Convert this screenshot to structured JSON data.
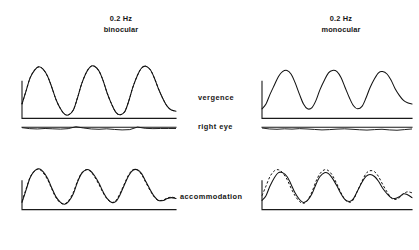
{
  "figure": {
    "columns": [
      {
        "id": "binocular",
        "frequency": "0.2 Hz",
        "condition": "binocular"
      },
      {
        "id": "monocular",
        "frequency": "0.2 Hz",
        "condition": "monocular"
      }
    ],
    "row_labels": {
      "vergence": "vergence",
      "right_eye": "right eye",
      "accommodation": "accommodation"
    },
    "colors": {
      "trace": "#111111",
      "axis": "#1a1a1a",
      "background": "#ffffff",
      "text": "#161616"
    }
  },
  "chart_data": {
    "type": "line",
    "xlabel": "",
    "ylabel": "",
    "grid": false,
    "legend_position": "none",
    "x_unit": "time (three stimulus cycles at 0.2 Hz)",
    "cycles": 3,
    "axis_style": "L-shaped calibration axis (vertical calibration bar plus horizontal time baseline)",
    "panels": [
      {
        "id": "vergence-binocular",
        "column": "binocular",
        "row": "vergence",
        "xlim": [
          0,
          3
        ],
        "ylim": [
          0,
          1
        ],
        "baseline": 0.06,
        "series": [
          {
            "name": "vergence response",
            "style": "solid",
            "phase_deg": 0,
            "amplitude": 0.78,
            "mean": 0.46,
            "x": [
              0.0,
              0.08,
              0.16,
              0.25,
              0.33,
              0.41,
              0.5,
              0.58,
              0.66,
              0.75,
              0.83,
              0.91,
              1.0,
              1.08,
              1.16,
              1.25,
              1.33,
              1.41,
              1.5,
              1.58,
              1.66,
              1.75,
              1.83,
              1.91,
              2.0,
              2.08,
              2.16,
              2.25,
              2.33,
              2.41,
              2.5,
              2.58,
              2.66,
              2.75,
              2.83,
              2.91,
              3.0
            ],
            "values": [
              0.3,
              0.52,
              0.74,
              0.87,
              0.92,
              0.88,
              0.76,
              0.58,
              0.38,
              0.22,
              0.13,
              0.12,
              0.2,
              0.4,
              0.63,
              0.82,
              0.92,
              0.93,
              0.85,
              0.69,
              0.48,
              0.29,
              0.16,
              0.12,
              0.17,
              0.35,
              0.58,
              0.78,
              0.9,
              0.93,
              0.87,
              0.73,
              0.55,
              0.38,
              0.26,
              0.2,
              0.18
            ]
          },
          {
            "name": "vergence stimulus",
            "style": "dashed",
            "phase_deg": 0,
            "amplitude": 0.78,
            "mean": 0.46,
            "note": "overlays the response almost exactly; visible mainly on descending limbs",
            "x": [
              0.0,
              0.08,
              0.16,
              0.25,
              0.33,
              0.41,
              0.5,
              0.58,
              0.66,
              0.75,
              0.83,
              0.91,
              1.0,
              1.08,
              1.16,
              1.25,
              1.33,
              1.41,
              1.5,
              1.58,
              1.66,
              1.75,
              1.83,
              1.91,
              2.0,
              2.08,
              2.16,
              2.25,
              2.33,
              2.41,
              2.5,
              2.58,
              2.66,
              2.75,
              2.83,
              2.91,
              3.0
            ],
            "values": [
              0.3,
              0.52,
              0.74,
              0.87,
              0.92,
              0.88,
              0.76,
              0.58,
              0.38,
              0.22,
              0.13,
              0.12,
              0.2,
              0.4,
              0.63,
              0.82,
              0.92,
              0.93,
              0.85,
              0.69,
              0.48,
              0.29,
              0.16,
              0.12,
              0.17,
              0.35,
              0.58,
              0.78,
              0.9,
              0.93,
              0.87,
              0.73,
              0.55,
              0.38,
              0.26,
              0.2,
              0.18
            ]
          }
        ]
      },
      {
        "id": "vergence-monocular",
        "column": "monocular",
        "row": "vergence",
        "xlim": [
          0,
          3
        ],
        "ylim": [
          0,
          1
        ],
        "baseline": 0.06,
        "series": [
          {
            "name": "vergence response",
            "style": "solid",
            "phase_deg": 0,
            "amplitude": 0.62,
            "mean": 0.48,
            "note": "no dashed stimulus trace shown; response is smaller and flat-topped",
            "x": [
              0.0,
              0.08,
              0.16,
              0.25,
              0.33,
              0.41,
              0.5,
              0.58,
              0.66,
              0.75,
              0.83,
              0.91,
              1.0,
              1.08,
              1.16,
              1.25,
              1.33,
              1.41,
              1.5,
              1.58,
              1.66,
              1.75,
              1.83,
              1.91,
              2.0,
              2.08,
              2.16,
              2.25,
              2.33,
              2.41,
              2.5,
              2.58,
              2.66,
              2.75,
              2.83,
              2.91,
              3.0
            ],
            "values": [
              0.22,
              0.3,
              0.46,
              0.62,
              0.76,
              0.84,
              0.86,
              0.8,
              0.66,
              0.46,
              0.3,
              0.22,
              0.24,
              0.36,
              0.54,
              0.7,
              0.82,
              0.86,
              0.84,
              0.74,
              0.58,
              0.4,
              0.27,
              0.22,
              0.26,
              0.4,
              0.57,
              0.72,
              0.82,
              0.84,
              0.8,
              0.7,
              0.56,
              0.44,
              0.36,
              0.32,
              0.3
            ]
          }
        ]
      },
      {
        "id": "righteye-binocular",
        "column": "binocular",
        "row": "right_eye",
        "xlim": [
          0,
          3
        ],
        "ylim": [
          0,
          1
        ],
        "baseline": 0.55,
        "series": [
          {
            "name": "right eye position",
            "style": "solid-noisy",
            "amplitude": 0.06,
            "mean": 0.5,
            "note": "essentially flat with small noise excursions",
            "x": [
              0.0,
              0.15,
              0.3,
              0.45,
              0.6,
              0.75,
              0.9,
              1.05,
              1.2,
              1.35,
              1.5,
              1.65,
              1.8,
              1.95,
              2.1,
              2.25,
              2.4,
              2.55,
              2.7,
              2.85,
              3.0
            ],
            "values": [
              0.52,
              0.46,
              0.44,
              0.47,
              0.45,
              0.43,
              0.46,
              0.58,
              0.5,
              0.44,
              0.42,
              0.45,
              0.41,
              0.38,
              0.4,
              0.56,
              0.48,
              0.46,
              0.47,
              0.47,
              0.47
            ]
          }
        ]
      },
      {
        "id": "righteye-monocular",
        "column": "monocular",
        "row": "right_eye",
        "xlim": [
          0,
          3
        ],
        "ylim": [
          0,
          1
        ],
        "baseline": 0.55,
        "series": [
          {
            "name": "right eye position",
            "style": "solid-noisy",
            "amplitude": 0.07,
            "mean": 0.5,
            "note": "essentially flat with small noise excursions",
            "x": [
              0.0,
              0.15,
              0.3,
              0.45,
              0.6,
              0.75,
              0.9,
              1.05,
              1.2,
              1.35,
              1.5,
              1.65,
              1.8,
              1.95,
              2.1,
              2.25,
              2.4,
              2.55,
              2.7,
              2.85,
              3.0
            ],
            "values": [
              0.5,
              0.44,
              0.42,
              0.45,
              0.43,
              0.46,
              0.44,
              0.41,
              0.38,
              0.4,
              0.43,
              0.45,
              0.42,
              0.39,
              0.37,
              0.4,
              0.42,
              0.38,
              0.36,
              0.4,
              0.44
            ]
          }
        ]
      },
      {
        "id": "accommodation-binocular",
        "column": "binocular",
        "row": "accommodation",
        "xlim": [
          0,
          3
        ],
        "ylim": [
          0,
          1
        ],
        "baseline": 0.05,
        "series": [
          {
            "name": "accommodation response",
            "style": "solid",
            "phase_deg": 0,
            "amplitude": 0.72,
            "mean": 0.48,
            "x": [
              0.0,
              0.08,
              0.16,
              0.25,
              0.33,
              0.41,
              0.5,
              0.58,
              0.66,
              0.75,
              0.83,
              0.91,
              1.0,
              1.08,
              1.16,
              1.25,
              1.33,
              1.41,
              1.5,
              1.58,
              1.66,
              1.75,
              1.83,
              1.91,
              2.0,
              2.08,
              2.16,
              2.25,
              2.33,
              2.41,
              2.5,
              2.58,
              2.66,
              2.75,
              2.83,
              2.91,
              3.0
            ],
            "values": [
              0.2,
              0.46,
              0.72,
              0.86,
              0.9,
              0.84,
              0.7,
              0.5,
              0.32,
              0.2,
              0.16,
              0.22,
              0.38,
              0.62,
              0.8,
              0.88,
              0.86,
              0.76,
              0.6,
              0.42,
              0.28,
              0.2,
              0.22,
              0.36,
              0.58,
              0.76,
              0.87,
              0.88,
              0.8,
              0.64,
              0.46,
              0.32,
              0.24,
              0.24,
              0.28,
              0.3,
              0.28
            ]
          },
          {
            "name": "accommodation stimulus",
            "style": "dashed",
            "phase_deg": 0,
            "amplitude": 0.72,
            "mean": 0.48,
            "note": "near-perfect overlay with the response under binocular viewing",
            "x": [
              0.0,
              0.08,
              0.16,
              0.25,
              0.33,
              0.41,
              0.5,
              0.58,
              0.66,
              0.75,
              0.83,
              0.91,
              1.0,
              1.08,
              1.16,
              1.25,
              1.33,
              1.41,
              1.5,
              1.58,
              1.66,
              1.75,
              1.83,
              1.91,
              2.0,
              2.08,
              2.16,
              2.25,
              2.33,
              2.41,
              2.5,
              2.58,
              2.66,
              2.75,
              2.83,
              2.91,
              3.0
            ],
            "values": [
              0.22,
              0.48,
              0.73,
              0.86,
              0.89,
              0.82,
              0.67,
              0.48,
              0.3,
              0.19,
              0.17,
              0.24,
              0.41,
              0.64,
              0.81,
              0.88,
              0.85,
              0.74,
              0.57,
              0.4,
              0.27,
              0.2,
              0.24,
              0.39,
              0.6,
              0.78,
              0.88,
              0.87,
              0.78,
              0.62,
              0.44,
              0.31,
              0.24,
              0.25,
              0.29,
              0.31,
              0.29
            ]
          }
        ]
      },
      {
        "id": "accommodation-monocular",
        "column": "monocular",
        "row": "accommodation",
        "xlim": [
          0,
          3
        ],
        "ylim": [
          0,
          1
        ],
        "baseline": 0.05,
        "series": [
          {
            "name": "accommodation response",
            "style": "solid",
            "phase_deg": -28,
            "amplitude": 0.64,
            "mean": 0.46,
            "note": "lags the dashed stimulus by a visible phase offset",
            "x": [
              0.0,
              0.08,
              0.16,
              0.25,
              0.33,
              0.41,
              0.5,
              0.58,
              0.66,
              0.75,
              0.83,
              0.91,
              1.0,
              1.08,
              1.16,
              1.25,
              1.33,
              1.41,
              1.5,
              1.58,
              1.66,
              1.75,
              1.83,
              1.91,
              2.0,
              2.08,
              2.16,
              2.25,
              2.33,
              2.41,
              2.5,
              2.58,
              2.66,
              2.75,
              2.83,
              2.91,
              3.0
            ],
            "values": [
              0.24,
              0.34,
              0.54,
              0.72,
              0.82,
              0.82,
              0.74,
              0.58,
              0.4,
              0.26,
              0.2,
              0.24,
              0.38,
              0.58,
              0.74,
              0.82,
              0.8,
              0.7,
              0.54,
              0.38,
              0.26,
              0.22,
              0.28,
              0.44,
              0.62,
              0.74,
              0.78,
              0.74,
              0.64,
              0.5,
              0.38,
              0.3,
              0.28,
              0.32,
              0.38,
              0.36,
              0.3
            ]
          },
          {
            "name": "accommodation stimulus",
            "style": "dashed",
            "phase_deg": 0,
            "amplitude": 0.68,
            "mean": 0.46,
            "note": "leads the solid response trace",
            "x": [
              0.0,
              0.08,
              0.16,
              0.25,
              0.33,
              0.41,
              0.5,
              0.58,
              0.66,
              0.75,
              0.83,
              0.91,
              1.0,
              1.08,
              1.16,
              1.25,
              1.33,
              1.41,
              1.5,
              1.58,
              1.66,
              1.75,
              1.83,
              1.91,
              2.0,
              2.08,
              2.16,
              2.25,
              2.33,
              2.41,
              2.5,
              2.58,
              2.66,
              2.75,
              2.83,
              2.91,
              3.0
            ],
            "values": [
              0.34,
              0.54,
              0.74,
              0.86,
              0.88,
              0.82,
              0.68,
              0.5,
              0.34,
              0.22,
              0.18,
              0.24,
              0.42,
              0.64,
              0.8,
              0.88,
              0.86,
              0.76,
              0.58,
              0.4,
              0.26,
              0.2,
              0.26,
              0.44,
              0.64,
              0.8,
              0.86,
              0.84,
              0.74,
              0.58,
              0.42,
              0.3,
              0.26,
              0.3,
              0.38,
              0.42,
              0.4
            ]
          }
        ]
      }
    ]
  }
}
